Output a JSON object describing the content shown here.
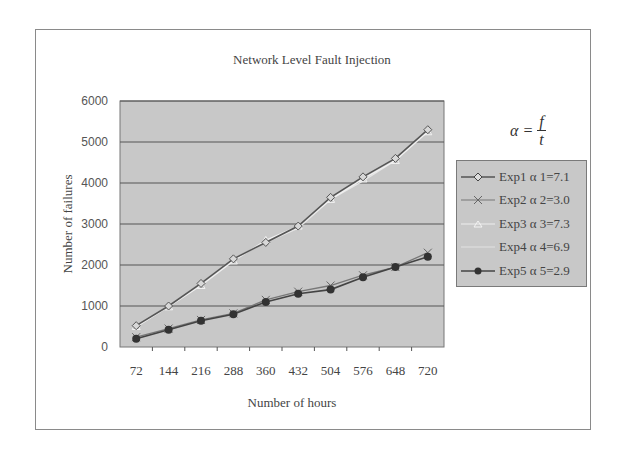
{
  "chart_data": {
    "type": "line",
    "title": "Network Level Fault Injection",
    "xlabel": "Number of hours",
    "ylabel": "Number of failures",
    "x": [
      72,
      144,
      216,
      288,
      360,
      432,
      504,
      576,
      648,
      720
    ],
    "ylim": [
      0,
      6000
    ],
    "yticks": [
      0,
      1000,
      2000,
      3000,
      4000,
      5000,
      6000
    ],
    "grid": true,
    "legend_position": "right",
    "annotation": "α = f / t",
    "series": [
      {
        "name": "Exp1 α1=7.1",
        "marker": "diamond-open",
        "color": "#555555",
        "values": [
          520,
          1000,
          1550,
          2150,
          2550,
          2950,
          3650,
          4150,
          4600,
          5300
        ]
      },
      {
        "name": "Exp2 α2=3.0",
        "marker": "x",
        "color": "#777777",
        "values": [
          240,
          450,
          660,
          820,
          1150,
          1350,
          1500,
          1750,
          1950,
          2300
        ]
      },
      {
        "name": "Exp3 α3=7.3",
        "marker": "triangle",
        "color": "#f0f0f0",
        "values": [
          500,
          980,
          1500,
          2100,
          2600,
          2950,
          3600,
          4100,
          4550,
          5250
        ]
      },
      {
        "name": "Exp4 α4=6.9",
        "marker": "none",
        "color": "#e6e6e6",
        "values": [
          480,
          1000,
          1550,
          2150,
          2550,
          2900,
          3600,
          4050,
          4550,
          5300
        ]
      },
      {
        "name": "Exp5 α5=2.9",
        "marker": "circle-filled",
        "color": "#444444",
        "values": [
          200,
          420,
          640,
          800,
          1100,
          1300,
          1400,
          1700,
          1950,
          2200
        ]
      }
    ]
  },
  "title": "Network Level Fault Injection",
  "axes": {
    "xlabel": "Number of hours",
    "ylabel": "Number of failures",
    "xticks": [
      "72",
      "144",
      "216",
      "288",
      "360",
      "432",
      "504",
      "576",
      "648",
      "720"
    ],
    "yticks": [
      "0",
      "1000",
      "2000",
      "3000",
      "4000",
      "5000",
      "6000"
    ]
  },
  "formula": {
    "lhs": "α =",
    "numerator": "f",
    "denominator": "t"
  },
  "legend": [
    "Exp1  α 1=7.1",
    "Exp2  α 2=3.0",
    "Exp3  α 3=7.3",
    "Exp4  α 4=6.9",
    "Exp5  α 5=2.9"
  ],
  "colors": {
    "plot_bg": "#c8c8c8",
    "grid": "#555555",
    "frame": "#8a8a8a"
  }
}
